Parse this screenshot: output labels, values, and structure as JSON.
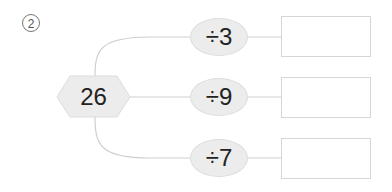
{
  "problem": {
    "number_label": "2",
    "start_value": "26",
    "operations": [
      {
        "label": "÷3",
        "answer": ""
      },
      {
        "label": "÷9",
        "answer": ""
      },
      {
        "label": "÷7",
        "answer": ""
      }
    ]
  },
  "colors": {
    "line": "#cfcfcf",
    "shape_fill": "#ececec"
  }
}
